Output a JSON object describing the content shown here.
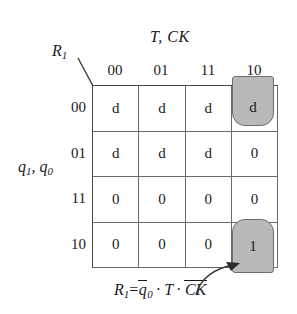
{
  "diagram": {
    "type": "karnaugh-map",
    "column_axis_label": "T, CK",
    "row_axis_label_main": "q",
    "row_axis_sub_1": "1",
    "row_axis_label_second": ", q",
    "row_axis_sub_2": "0",
    "corner_label_main": "R",
    "corner_label_sub": "1",
    "column_headers": [
      "00",
      "01",
      "11",
      "10"
    ],
    "row_headers": [
      "00",
      "01",
      "11",
      "10"
    ],
    "cells": [
      [
        "d",
        "d",
        "d",
        "d"
      ],
      [
        "d",
        "d",
        "d",
        "0"
      ],
      [
        "0",
        "0",
        "0",
        "0"
      ],
      [
        "0",
        "0",
        "0",
        "1"
      ]
    ],
    "highlight_top_value": "d",
    "highlight_bottom_value": "1",
    "highlight_fill_color": "#b9b9b9",
    "highlight_border_color": "#6e6e6e",
    "grid_line_color": "#6a6a6a"
  },
  "equation": {
    "lhs": "R",
    "lhs_sub": "1",
    "equals": "=",
    "term1_base": "q",
    "term1_sub": "0",
    "operator1": "·",
    "term2": "T",
    "operator2": "·",
    "term3": "CK",
    "full_text": "R1 = q0̅ · T · CK̅"
  }
}
